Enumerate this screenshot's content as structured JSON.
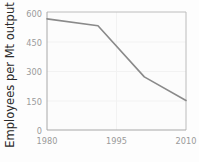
{
  "chart_data": {
    "type": "line",
    "title": "",
    "xlabel": "",
    "ylabel": "Employees per Mt output",
    "xlim": [
      1980,
      2010
    ],
    "ylim": [
      0,
      600
    ],
    "grid": true,
    "legend": null,
    "xticks": [
      "1980",
      "1995",
      "2010"
    ],
    "xtick_values": [
      1980,
      1995,
      2010
    ],
    "yticks": [
      "0",
      "150",
      "300",
      "450",
      "600"
    ],
    "ytick_values": [
      0,
      150,
      300,
      450,
      600
    ],
    "series": [
      {
        "name": "Employees per Mt output",
        "color": "#8a8a8a",
        "x": [
          1980,
          1991,
          2001,
          2010
        ],
        "values": [
          565,
          530,
          270,
          150
        ]
      }
    ]
  },
  "axes": {
    "y_title": "Employees per Mt output",
    "y_tick_0": "0",
    "y_tick_150": "150",
    "y_tick_300": "300",
    "y_tick_450": "450",
    "y_tick_600": "600",
    "x_tick_1980": "1980",
    "x_tick_1995": "1995",
    "x_tick_2010": "2010"
  },
  "colors": {
    "line": "#8a8a8a",
    "frame": "#b9b9b9",
    "grid": "#f0f0f0",
    "tick_text": "#9a9a9a",
    "title_text": "#2b2b2b",
    "plot_background": "#fdfdfd"
  }
}
